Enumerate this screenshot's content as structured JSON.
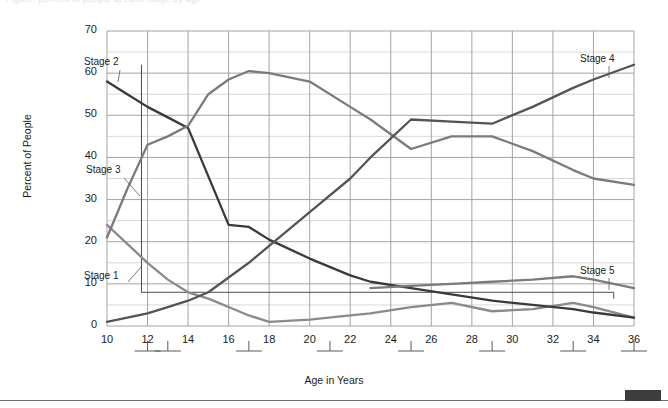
{
  "page": {
    "top_cut_text": "Figure: percent of people at each stage by age",
    "bottom_rule": "horizontal-rule",
    "corner_block": "dark-block"
  },
  "chart_data": {
    "type": "line",
    "title": "",
    "xlabel": "Age in Years",
    "ylabel": "Percent of People",
    "xlim": [
      10,
      36
    ],
    "ylim": [
      0,
      70
    ],
    "xticks": [
      10,
      12,
      14,
      16,
      18,
      20,
      22,
      24,
      26,
      28,
      30,
      32,
      34,
      36
    ],
    "yticks": [
      0,
      10,
      20,
      30,
      40,
      50,
      60,
      70
    ],
    "minor_y_step": 5,
    "grid": true,
    "legend": "inline-labels",
    "x": [
      10,
      11,
      12,
      13,
      14,
      15,
      16,
      17,
      18,
      20,
      22,
      23,
      25,
      27,
      29,
      31,
      33,
      34,
      36
    ],
    "series": [
      {
        "name": "Stage 1",
        "color": "#8a8a8a",
        "label_text": "Stage 1",
        "values": [
          24.0,
          19.5,
          15.0,
          11.0,
          8.0,
          6.5,
          4.5,
          2.5,
          1.0,
          1.5,
          2.5,
          3.0,
          4.5,
          5.5,
          3.5,
          4.0,
          5.5,
          4.5,
          2.0
        ]
      },
      {
        "name": "Stage 2",
        "color": "#3a3a3a",
        "label_text": "Stage 2",
        "values": [
          58.0,
          55.0,
          52.0,
          49.5,
          47.0,
          35.5,
          24.0,
          23.5,
          20.5,
          16.0,
          12.0,
          10.5,
          9.0,
          7.5,
          6.0,
          5.0,
          4.0,
          3.2,
          2.0
        ]
      },
      {
        "name": "Stage 3",
        "color": "#7b7b7b",
        "label_text": "Stage 3",
        "values": [
          21.0,
          32.5,
          43.0,
          45.0,
          47.5,
          55.0,
          58.5,
          60.5,
          60.0,
          58.0,
          52.0,
          49.0,
          42.0,
          45.0,
          45.0,
          41.5,
          37.0,
          35.0,
          33.5
        ]
      },
      {
        "name": "Stage 4",
        "color": "#545454",
        "label_text": "Stage 4",
        "values": [
          1.0,
          2.0,
          3.0,
          4.5,
          6.0,
          8.0,
          11.5,
          15.0,
          19.0,
          27.0,
          35.0,
          40.0,
          49.0,
          48.5,
          48.0,
          52.0,
          56.5,
          58.5,
          62.0
        ]
      },
      {
        "name": "Stage 5",
        "color": "#7b7b7b",
        "label_text": "Stage 5",
        "values": [
          null,
          null,
          null,
          null,
          null,
          null,
          null,
          null,
          null,
          null,
          null,
          9.0,
          9.5,
          10.0,
          10.5,
          11.0,
          11.8,
          11.0,
          9.0
        ]
      }
    ],
    "annotations": [
      {
        "name": "vertical-reference-line",
        "x": 11.7,
        "y_top": 62.0,
        "y_bottom": 8.0
      },
      {
        "name": "horizontal-reference-line",
        "x_start": 11.7,
        "x_end": 35.0,
        "y": 8.0
      },
      {
        "name": "vertical-reference-tick",
        "x": 35.0,
        "y_top": 8.0,
        "y_bottom": 6.5
      }
    ],
    "axis_brackets": [
      12,
      13,
      17,
      21,
      25,
      29,
      33,
      36
    ]
  },
  "labels": {
    "stage1": "Stage 1",
    "stage2": "Stage 2",
    "stage3": "Stage 3",
    "stage4": "Stage 4",
    "stage5": "Stage 5"
  }
}
